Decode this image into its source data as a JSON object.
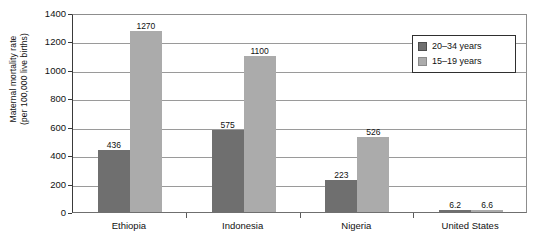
{
  "chart_data": {
    "type": "bar",
    "title": "",
    "xlabel": "",
    "ylabel": "Maternal mortality rate (per 100,000 live births)",
    "ylabel_line1": "Maternal mortality rate",
    "ylabel_line2": "(per 100,000 live births)",
    "categories": [
      "Ethiopia",
      "Indonesia",
      "Nigeria",
      "United States"
    ],
    "series": [
      {
        "name": "20–34 years",
        "color": "#6f6f6f",
        "values": [
          436,
          223,
          223,
          6.2
        ],
        "value_labels": [
          "436",
          "575",
          "223",
          "6.2"
        ],
        "data": [
          436,
          575,
          223,
          6.2
        ]
      },
      {
        "name": "15–19 years",
        "color": "#ababab",
        "values": [
          1270,
          1100,
          526,
          6.6
        ],
        "value_labels": [
          "1270",
          "1100",
          "526",
          "6.6"
        ],
        "data": [
          1270,
          1100,
          526,
          6.6
        ]
      }
    ],
    "ylim": [
      0,
      1400
    ],
    "yticks": [
      0,
      200,
      400,
      600,
      800,
      1000,
      1200,
      1400
    ],
    "ytick_labels": [
      "0",
      "200",
      "400",
      "600",
      "800",
      "1000",
      "1200",
      "1400"
    ],
    "grid": true,
    "legend_position": "top-right",
    "legend_entries": [
      "20–34 years",
      "15–19 years"
    ]
  }
}
